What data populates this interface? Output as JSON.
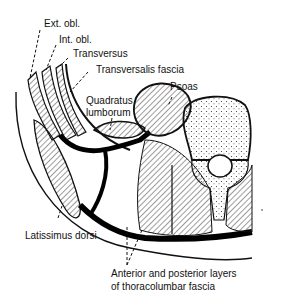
{
  "diagram": {
    "type": "anatomical cross-section",
    "labels": {
      "ext_obl": "Ext. obl.",
      "int_obl": "Int. obl.",
      "transversus": "Transversus",
      "transversalis_fascia": "Transversalis fascia",
      "quadratus_1": "Quadratus",
      "quadratus_2": "lumborum",
      "psoas": "Psoas",
      "latissimus": "Latissimus dorsi",
      "fascia_1": "Anterior and posterior layers",
      "fascia_2": "of thoracolumbar fascia"
    },
    "colors": {
      "ink": "#111111",
      "background": "#ffffff"
    }
  }
}
